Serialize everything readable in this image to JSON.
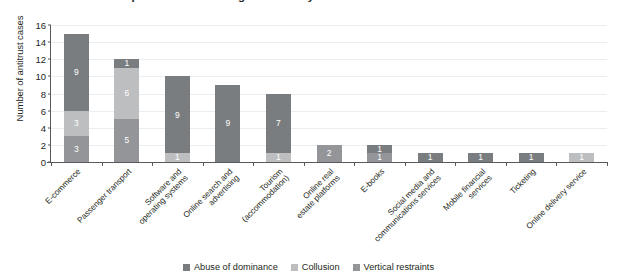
{
  "chart_data": {
    "type": "bar",
    "subtype": "stacked-vertical",
    "title": "...orldwide across multiple sectors of the digital economy",
    "xlabel": "",
    "ylabel": "Number of antitrust cases",
    "ylim": [
      0,
      16
    ],
    "yticks": [
      0,
      2,
      4,
      6,
      8,
      10,
      12,
      14,
      16
    ],
    "grid": true,
    "legend_position": "bottom-center",
    "categories": [
      "E-commerce",
      "Passenger transport",
      "Software and\noperating systems",
      "Online search and\nadvertising",
      "Tourism\n(accommodation)",
      "Online real\nestate platforms",
      "E-books",
      "Social media and\ncommunications services",
      "Mobile financial\nservices",
      "Ticketing",
      "Online delivery service"
    ],
    "series": [
      {
        "name": "Abuse of dominance",
        "color": "#7a7d80",
        "values": [
          9,
          1,
          9,
          9,
          7,
          0,
          1,
          1,
          1,
          1,
          0
        ]
      },
      {
        "name": "Collusion",
        "color": "#bcbec0",
        "values": [
          3,
          6,
          1,
          0,
          1,
          0,
          0,
          0,
          0,
          0,
          1
        ]
      },
      {
        "name": "Vertical restraints",
        "color": "#939598",
        "values": [
          3,
          5,
          0,
          0,
          0,
          2,
          1,
          0,
          0,
          0,
          0
        ]
      }
    ],
    "totals": [
      15,
      12,
      10,
      9,
      8,
      2,
      2,
      1,
      1,
      1,
      1
    ],
    "bar_labels": [
      [
        {
          "series": "Abuse of dominance",
          "value": "9"
        },
        {
          "series": "Collusion",
          "value": "3"
        },
        {
          "series": "Vertical restraints",
          "value": "3"
        }
      ],
      [
        {
          "series": "Abuse of dominance",
          "value": "1"
        },
        {
          "series": "Collusion",
          "value": "6"
        },
        {
          "series": "Vertical restraints",
          "value": "5"
        }
      ],
      [
        {
          "series": "Abuse of dominance",
          "value": "9"
        },
        {
          "series": "Collusion",
          "value": "1"
        }
      ],
      [
        {
          "series": "Abuse of dominance",
          "value": "9"
        }
      ],
      [
        {
          "series": "Abuse of dominance",
          "value": "7"
        },
        {
          "series": "Collusion",
          "value": "1"
        }
      ],
      [
        {
          "series": "Vertical restraints",
          "value": "2"
        }
      ],
      [
        {
          "series": "Abuse of dominance",
          "value": "1"
        },
        {
          "series": "Vertical restraints",
          "value": "1"
        }
      ],
      [
        {
          "series": "Abuse of dominance",
          "value": "1"
        }
      ],
      [
        {
          "series": "Abuse of dominance",
          "value": "1"
        }
      ],
      [
        {
          "series": "Abuse of dominance",
          "value": "1"
        }
      ],
      [
        {
          "series": "Collusion",
          "value": "1"
        }
      ]
    ]
  },
  "colors": {
    "abuse_of_dominance": "#7a7d80",
    "collusion": "#bcbec0",
    "vertical_restraints": "#939598",
    "axis": "#58595b",
    "grid": "#e9eef2",
    "text": "#231f20",
    "background": "#ffffff"
  }
}
